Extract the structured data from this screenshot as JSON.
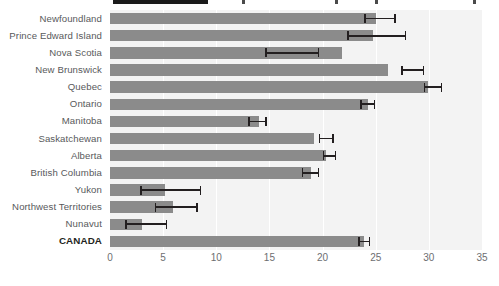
{
  "legend": {
    "swatch_name": "legend-rule",
    "tick_marks": [
      242,
      335,
      375,
      473
    ]
  },
  "axis": {
    "x_ticks": [
      0,
      5,
      10,
      15,
      20,
      25,
      30,
      35
    ],
    "x_min": 0,
    "x_max": 35,
    "grid": true
  },
  "chart_data": {
    "type": "bar",
    "orientation": "horizontal",
    "title": "",
    "subtitle": "",
    "xlabel": "",
    "ylabel": "",
    "xlim": [
      0,
      35
    ],
    "grid": true,
    "legend_position": "top",
    "categories": [
      "Newfoundland",
      "Prince Edward Island",
      "Nova Scotia",
      "New Brunswick",
      "Quebec",
      "Ontario",
      "Manitoba",
      "Saskatchewan",
      "Alberta",
      "British Columbia",
      "Yukon",
      "Northwest Territories",
      "Nunavut",
      "CANADA"
    ],
    "values": [
      25.0,
      24.7,
      21.8,
      26.2,
      29.9,
      24.3,
      14.0,
      19.2,
      20.3,
      18.9,
      5.2,
      5.9,
      3.0,
      23.9
    ],
    "error_low": [
      24.0,
      22.4,
      14.7,
      27.5,
      29.6,
      23.6,
      13.1,
      19.7,
      20.1,
      18.1,
      2.9,
      4.3,
      1.5,
      23.4
    ],
    "error_high": [
      26.8,
      27.8,
      19.6,
      29.5,
      31.2,
      24.9,
      14.7,
      21.0,
      21.2,
      19.6,
      8.5,
      8.2,
      5.3,
      24.4
    ],
    "error_bar_left": [
      24.0,
      22.4,
      14.7,
      27.5,
      29.6,
      23.6,
      13.1,
      19.7,
      20.1,
      18.1,
      2.9,
      4.3,
      1.5,
      23.4
    ],
    "error_bar_right": [
      26.8,
      27.8,
      19.6,
      29.5,
      31.2,
      24.9,
      14.7,
      21.0,
      21.2,
      19.6,
      8.5,
      8.2,
      5.3,
      24.4
    ],
    "series": [
      {
        "name": "rate",
        "values": [
          25.0,
          24.7,
          21.8,
          26.2,
          29.9,
          24.3,
          14.0,
          19.2,
          20.3,
          18.9,
          5.2,
          5.9,
          3.0,
          23.9
        ]
      }
    ],
    "total_row_index": 13,
    "bar_color": "#8b8b8b",
    "error_color": "#231f20",
    "panel_color": "#f3f3f3",
    "gridline_color": "#ffffff"
  }
}
